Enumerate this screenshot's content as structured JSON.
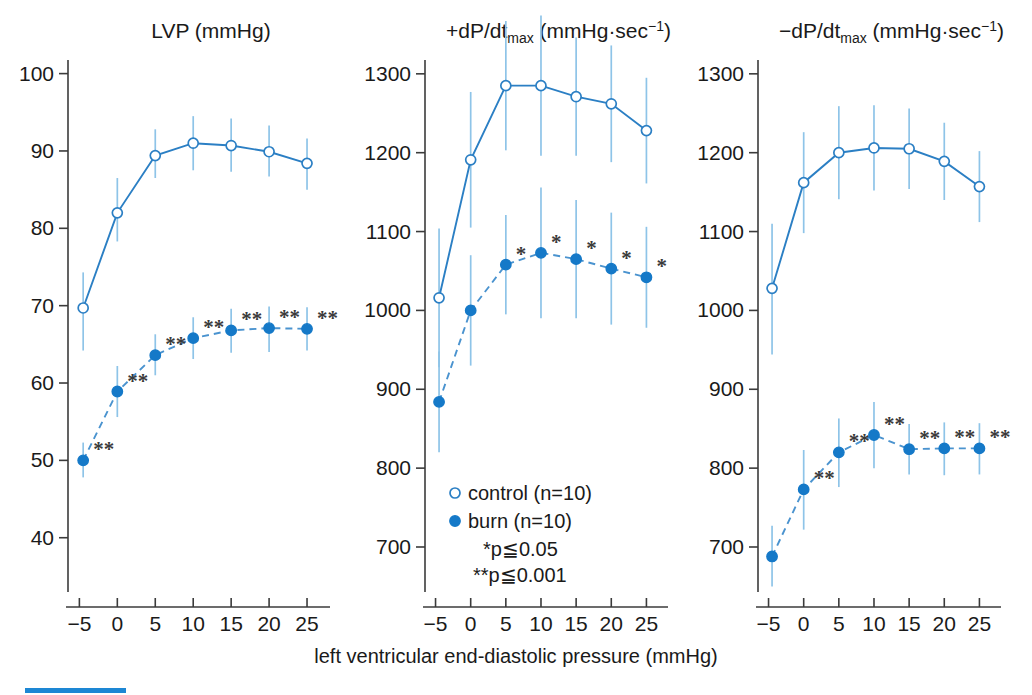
{
  "figure": {
    "xlabel": "left ventricular end-diastolic pressure (mmHg)",
    "accent_color": "#1579c8",
    "line_color": "#2b7fc4",
    "errorbar_color": "#8ec4e8",
    "text_color": "#1a1a1a"
  },
  "legend": {
    "control_label": "control (n=10)",
    "burn_label": "burn (n=10)",
    "p05_label": "*p≦0.05",
    "p001_label": "**p≦0.001",
    "control_marker": "open-circle",
    "burn_marker": "filled-circle"
  },
  "bottom_bar": {
    "name": "page-accent-bar",
    "color": "#1d87d4"
  },
  "chart_data": [
    {
      "id": "lvp",
      "type": "line",
      "title": "LVP (mmHg)",
      "title_parts": {
        "main": "LVP",
        "unit": "(mmHg)"
      },
      "xlabel": "left ventricular end-diastolic pressure (mmHg)",
      "ylabel": "",
      "x": [
        -4.5,
        0,
        5,
        10,
        15,
        20,
        25
      ],
      "xticks": [
        -5,
        0,
        5,
        10,
        15,
        20,
        25
      ],
      "xticklabels": [
        "−5",
        "0",
        "5",
        "10",
        "15",
        "20",
        "25"
      ],
      "yticks": [
        40,
        50,
        60,
        70,
        80,
        90,
        100
      ],
      "yticklabels": [
        "40",
        "50",
        "60",
        "70",
        "80",
        "90",
        "100"
      ],
      "xlim": [
        -6.5,
        27.5
      ],
      "ylim": [
        33.5,
        101.5
      ],
      "grid": false,
      "legend_position": "none",
      "series": [
        {
          "name": "control (n=10)",
          "marker": "open-circle",
          "linestyle": "solid",
          "values": [
            69.7,
            82.0,
            89.4,
            91.0,
            90.7,
            89.9,
            88.4
          ],
          "err_low": [
            64.2,
            78.3,
            86.5,
            87.5,
            87.3,
            86.7,
            85.0
          ],
          "err_high": [
            74.3,
            86.5,
            92.8,
            94.5,
            94.2,
            93.3,
            91.6
          ],
          "sig": [
            "",
            "",
            "",
            "",
            "",
            "",
            ""
          ]
        },
        {
          "name": "burn (n=10)",
          "marker": "filled-circle",
          "linestyle": "dashed",
          "values": [
            50.0,
            58.9,
            63.6,
            65.8,
            66.8,
            67.1,
            67.0
          ],
          "err_low": [
            47.8,
            55.6,
            61.0,
            63.1,
            63.9,
            64.0,
            64.2
          ],
          "err_high": [
            52.3,
            62.2,
            66.3,
            68.5,
            69.6,
            69.9,
            69.8
          ],
          "sig": [
            "**",
            "**",
            "**",
            "**",
            "**",
            "**",
            "**"
          ]
        }
      ]
    },
    {
      "id": "dpdt_max_pos",
      "type": "line",
      "title": "+dP/dt_max (mmHg·sec⁻¹)",
      "title_parts": {
        "main": "+dP/dt",
        "sub": "max",
        "unit": "(mmHg·sec",
        "sup": "−1",
        "unit_close": ")"
      },
      "xlabel": "left ventricular end-diastolic pressure (mmHg)",
      "ylabel": "",
      "x": [
        -4.5,
        0,
        5,
        10,
        15,
        20,
        25
      ],
      "xticks": [
        -5,
        0,
        5,
        10,
        15,
        20,
        25
      ],
      "xticklabels": [
        "−5",
        "0",
        "5",
        "10",
        "15",
        "20",
        "25"
      ],
      "yticks": [
        700,
        800,
        900,
        1000,
        1100,
        1200,
        1300
      ],
      "yticklabels": [
        "700",
        "800",
        "900",
        "1000",
        "1100",
        "1200",
        "1300"
      ],
      "xlim": [
        -6.5,
        27.5
      ],
      "ylim": [
        648,
        1315
      ],
      "grid": false,
      "legend_position": "lower-center",
      "series": [
        {
          "name": "control (n=10)",
          "marker": "open-circle",
          "linestyle": "solid",
          "values": [
            1016,
            1191,
            1285,
            1285,
            1271,
            1262,
            1228
          ],
          "err_low": [
            928,
            1105,
            1203,
            1196,
            1196,
            1188,
            1161
          ],
          "err_high": [
            1104,
            1277,
            1367,
            1374,
            1346,
            1336,
            1295
          ],
          "sig": [
            "",
            "",
            "",
            "",
            "",
            "",
            ""
          ]
        },
        {
          "name": "burn (n=10)",
          "marker": "filled-circle",
          "linestyle": "dashed",
          "values": [
            884,
            1000,
            1058,
            1073,
            1065,
            1053,
            1042
          ],
          "err_low": [
            820,
            930,
            995,
            990,
            990,
            982,
            978
          ],
          "err_high": [
            948,
            1070,
            1121,
            1156,
            1140,
            1124,
            1106
          ],
          "sig": [
            "",
            "",
            "*",
            "*",
            "*",
            "*",
            "*"
          ]
        }
      ]
    },
    {
      "id": "dpdt_max_neg",
      "type": "line",
      "title": "−dP/dt_max (mmHg·sec⁻¹)",
      "title_parts": {
        "main": "−dP/dt",
        "sub": "max",
        "unit": "(mmHg·sec",
        "sup": "−1",
        "unit_close": ")"
      },
      "xlabel": "left ventricular end-diastolic pressure (mmHg)",
      "ylabel": "",
      "x": [
        -4.5,
        0,
        5,
        10,
        15,
        20,
        25
      ],
      "xticks": [
        -5,
        0,
        5,
        10,
        15,
        20,
        25
      ],
      "xticklabels": [
        "−5",
        "0",
        "5",
        "10",
        "15",
        "20",
        "25"
      ],
      "yticks": [
        700,
        800,
        900,
        1000,
        1100,
        1200,
        1300
      ],
      "yticklabels": [
        "700",
        "800",
        "900",
        "1000",
        "1100",
        "1200",
        "1300"
      ],
      "xlim": [
        -6.5,
        27.5
      ],
      "ylim": [
        648,
        1315
      ],
      "grid": false,
      "legend_position": "none",
      "series": [
        {
          "name": "control (n=10)",
          "marker": "open-circle",
          "linestyle": "solid",
          "values": [
            1028,
            1162,
            1200,
            1206,
            1205,
            1189,
            1157
          ],
          "err_low": [
            944,
            1098,
            1141,
            1152,
            1154,
            1140,
            1112
          ],
          "err_high": [
            1110,
            1226,
            1259,
            1260,
            1256,
            1238,
            1202
          ],
          "sig": [
            "",
            "",
            "",
            "",
            "",
            "",
            ""
          ]
        },
        {
          "name": "burn (n=10)",
          "marker": "filled-circle",
          "linestyle": "dashed",
          "values": [
            688,
            773,
            820,
            842,
            824,
            825,
            825
          ],
          "err_low": [
            650,
            722,
            776,
            800,
            792,
            791,
            792
          ],
          "err_high": [
            727,
            823,
            863,
            884,
            856,
            858,
            857
          ],
          "sig": [
            "",
            "**",
            "**",
            "**",
            "**",
            "**",
            "**"
          ]
        }
      ]
    }
  ]
}
